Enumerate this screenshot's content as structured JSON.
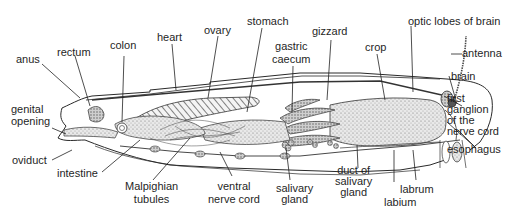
{
  "diagram": {
    "labels": {
      "anus": "anus",
      "rectum": "rectum",
      "colon": "colon",
      "heart": "heart",
      "ovary": "ovary",
      "stomach": "stomach",
      "gastric_caecum_1": "gastric",
      "gastric_caecum_2": "caecum",
      "gizzard": "gizzard",
      "crop": "crop",
      "optic_lobes": "optic lobes of brain",
      "antenna": "antenna",
      "brain": "brain",
      "first_ganglion_1": "first",
      "first_ganglion_2": "ganglion",
      "first_ganglion_3": "of the",
      "first_ganglion_4": "nerve cord",
      "genital_opening_1": "genital",
      "genital_opening_2": "opening",
      "oviduct": "oviduct",
      "intestine": "intestine",
      "malpighian_1": "Malpighian",
      "malpighian_2": "tubules",
      "ventral_nerve_1": "ventral",
      "ventral_nerve_2": "nerve cord",
      "salivary_gland_1": "salivary",
      "salivary_gland_2": "gland",
      "duct_salivary_1": "duct of",
      "duct_salivary_2": "salivary",
      "duct_salivary_3": "gland",
      "labrum": "labrum",
      "labium": "labium",
      "esophagus": "esophagus"
    },
    "colors": {
      "ink": "#1f1f1f",
      "shade": "#bdbdbd",
      "background": "#ffffff"
    }
  }
}
